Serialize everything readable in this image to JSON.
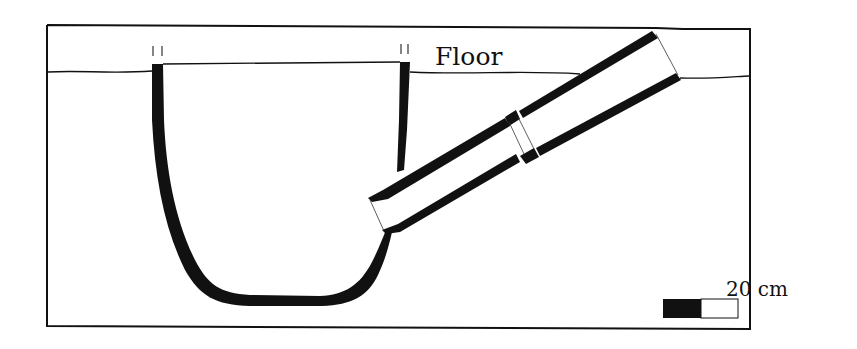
{
  "diagram": {
    "type": "cross-section",
    "labels": {
      "floor": "Floor",
      "scale": "20 cm"
    },
    "elements": [
      {
        "name": "frame",
        "kind": "rectangle"
      },
      {
        "name": "floor-line",
        "kind": "line"
      },
      {
        "name": "pit-vessel",
        "kind": "U-shaped container wall"
      },
      {
        "name": "pipe-lower-section",
        "kind": "pipe"
      },
      {
        "name": "pipe-joint",
        "kind": "collar"
      },
      {
        "name": "pipe-upper-section",
        "kind": "pipe"
      },
      {
        "name": "rim-marks",
        "kind": "tick marks"
      },
      {
        "name": "scale-bar",
        "kind": "scale bar",
        "segments": [
          "black",
          "white"
        ]
      }
    ],
    "colors": {
      "ink": "#111111",
      "background": "#ffffff"
    }
  }
}
